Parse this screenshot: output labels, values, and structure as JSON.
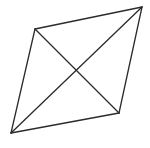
{
  "diagram": {
    "type": "quadrilateral-with-diagonals",
    "shape": "parallelogram",
    "stroke_color": "#2b2b2b",
    "background": "#ffffff",
    "vertices": {
      "top_left": [
        35,
        29
      ],
      "top_right": [
        142,
        7
      ],
      "bottom_right": [
        119,
        113
      ],
      "bottom_left": [
        11,
        133
      ]
    },
    "edges": [
      [
        "top_left",
        "top_right"
      ],
      [
        "top_right",
        "bottom_right"
      ],
      [
        "bottom_right",
        "bottom_left"
      ],
      [
        "bottom_left",
        "top_left"
      ]
    ],
    "diagonals": [
      [
        "top_left",
        "bottom_right"
      ],
      [
        "bottom_left",
        "top_right"
      ]
    ]
  }
}
